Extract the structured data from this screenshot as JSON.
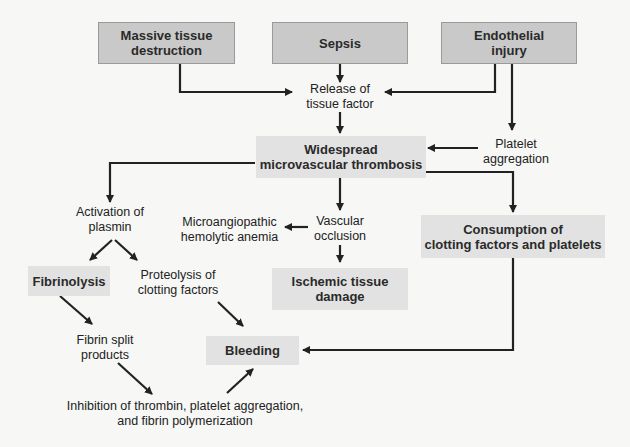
{
  "diagram": {
    "nodes": {
      "massive_tissue": "Massive tissue destruction",
      "sepsis": "Sepsis",
      "endothelial": "Endothelial injury",
      "release_tf_1": "Release of",
      "release_tf_2": "tissue factor",
      "platelet_agg_1": "Platelet",
      "platelet_agg_2": "aggregation",
      "widespread_1": "Widespread",
      "widespread_2": "microvascular thrombosis",
      "activation_1": "Activation of",
      "activation_2": "plasmin",
      "mah_1": "Microangiopathic",
      "mah_2": "hemolytic anemia",
      "vascular_1": "Vascular",
      "vascular_2": "occlusion",
      "consumption_1": "Consumption of",
      "consumption_2": "clotting factors and platelets",
      "fibrinolysis": "Fibrinolysis",
      "proteolysis_1": "Proteolysis of",
      "proteolysis_2": "clotting factors",
      "ischemic_1": "Ischemic tissue",
      "ischemic_2": "damage",
      "fsp_1": "Fibrin split",
      "fsp_2": "products",
      "bleeding": "Bleeding",
      "inhibition_1": "Inhibition of thrombin, platelet aggregation,",
      "inhibition_2": "and fibrin polymerization"
    },
    "colors": {
      "top_box": "#c9c9c9",
      "lower_box": "#e2e2e2",
      "arrow": "#222222",
      "background": "#f7f7f5"
    }
  }
}
